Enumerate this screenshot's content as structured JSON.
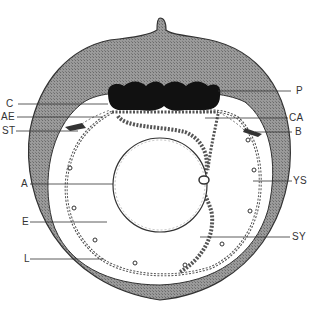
{
  "diagram": {
    "type": "anatomical cross-section",
    "colors": {
      "shell": "#8c8c8c",
      "shell_edge": "#333333",
      "placenta": "#111111",
      "membrane": "#555555",
      "background": "#ffffff",
      "label": "#333333"
    },
    "labels": {
      "left": [
        {
          "key": "C",
          "text": "C",
          "x": 6,
          "y": 100
        },
        {
          "key": "AE",
          "text": "AE",
          "x": 2,
          "y": 113
        },
        {
          "key": "ST",
          "text": "ST",
          "x": 3,
          "y": 128
        },
        {
          "key": "A",
          "text": "A",
          "x": 21,
          "y": 180
        },
        {
          "key": "E",
          "text": "E",
          "x": 22,
          "y": 218
        },
        {
          "key": "L",
          "text": "L",
          "x": 24,
          "y": 255
        }
      ],
      "right": [
        {
          "key": "P",
          "text": "P",
          "x": 297,
          "y": 87
        },
        {
          "key": "CA",
          "text": "CA",
          "x": 290,
          "y": 114
        },
        {
          "key": "B",
          "text": "B",
          "x": 296,
          "y": 128
        },
        {
          "key": "YS",
          "text": "YS",
          "x": 293,
          "y": 177
        },
        {
          "key": "SY",
          "text": "SY",
          "x": 293,
          "y": 233
        }
      ]
    }
  }
}
